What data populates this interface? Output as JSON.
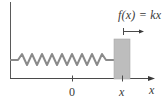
{
  "diagram": {
    "force_label": "f(x) = kx",
    "origin_tick_label": "0",
    "position_tick_label": "x",
    "axis_label": "x",
    "spring_peaks": 9,
    "colors": {
      "line": "#4a4a4a",
      "spring": "#8a8a8a",
      "block_fill": "#bdbdbd",
      "block_edge": "#a8a8a8",
      "text": "#3a3a3a",
      "background": "#ffffff"
    }
  }
}
